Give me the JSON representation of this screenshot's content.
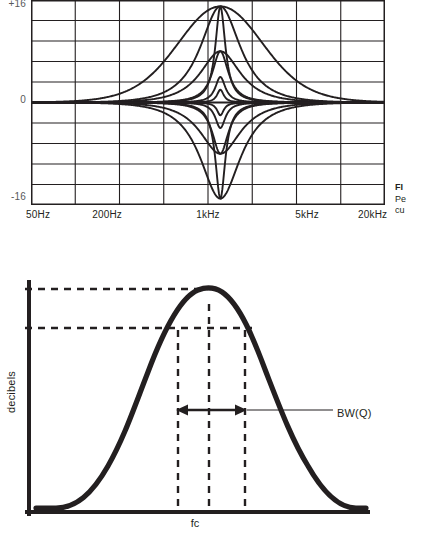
{
  "document": {
    "title": "Parametric EQ response curves and bandwidth diagram",
    "page_background": "#ffffff",
    "ink_color": "#231f20",
    "grid_color": "#231f20",
    "axis_label_color": "#58595b"
  },
  "figure_one": {
    "caption": {
      "head": "FI",
      "lines": [
        "Pe",
        "cu"
      ]
    },
    "y_axis": {
      "label_top": "+16",
      "label_mid": "0",
      "label_bottom": "-16",
      "units": "dB",
      "range": [
        -16,
        16
      ]
    },
    "x_axis": {
      "ticks": [
        "50Hz",
        "200Hz",
        "1kHz",
        "5kHz",
        "20kHz"
      ],
      "tick_positions_pct": [
        2,
        21.5,
        50,
        78,
        96.5
      ],
      "scale": "logarithmic"
    },
    "grid": {
      "columns": 8,
      "rows": 10,
      "vertical_lines": 7,
      "horizontal_lines": 9,
      "border": true
    }
  },
  "chart_data": [
    {
      "type": "line",
      "title": "Parametric EQ peaking filter family",
      "xlabel": "",
      "ylabel": "",
      "xtick_labels": [
        "50Hz",
        "200Hz",
        "1kHz",
        "5kHz",
        "20kHz"
      ],
      "ytick_labels": [
        "+16",
        "0",
        "-16"
      ],
      "ylim": [
        -16,
        16
      ],
      "xlim_hz": [
        20,
        30000
      ],
      "xscale": "log",
      "grid": true,
      "legend": "none",
      "center_frequency_hz": 1000,
      "series": [
        {
          "name": "boost +15 dB, Q 0.4",
          "gain_db": 15.0,
          "q": 0.4,
          "fc_hz": 1000
        },
        {
          "name": "boost +15 dB, Q 1.0",
          "gain_db": 15.0,
          "q": 1.0,
          "fc_hz": 1000
        },
        {
          "name": "boost +15 dB, Q 4.0",
          "gain_db": 15.0,
          "q": 4.0,
          "fc_hz": 1000
        },
        {
          "name": "boost +8 dB, Q 1.0",
          "gain_db": 8.0,
          "q": 1.0,
          "fc_hz": 1000
        },
        {
          "name": "boost +8 dB, Q 2.5",
          "gain_db": 8.0,
          "q": 2.5,
          "fc_hz": 1000
        },
        {
          "name": "boost +4 dB, Q 4.0",
          "gain_db": 4.0,
          "q": 4.0,
          "fc_hz": 1000
        },
        {
          "name": "boost +2 dB, Q 6.0",
          "gain_db": 2.0,
          "q": 6.0,
          "fc_hz": 1000
        },
        {
          "name": "cut -2 dB, Q 6.0",
          "gain_db": -2.0,
          "q": 6.0,
          "fc_hz": 1000
        },
        {
          "name": "cut -4 dB, Q 4.0",
          "gain_db": -4.0,
          "q": 4.0,
          "fc_hz": 1000
        },
        {
          "name": "cut -8 dB, Q 2.5",
          "gain_db": -8.0,
          "q": 2.5,
          "fc_hz": 1000
        },
        {
          "name": "cut -8 dB, Q 1.0",
          "gain_db": -8.0,
          "q": 1.0,
          "fc_hz": 1000
        },
        {
          "name": "cut -15 dB, Q 4.0",
          "gain_db": -15.0,
          "q": 4.0,
          "fc_hz": 1000
        },
        {
          "name": "cut -15 dB, Q 1.0",
          "gain_db": -15.0,
          "q": 1.0,
          "fc_hz": 1000
        }
      ]
    },
    {
      "type": "line",
      "title": "Bandwidth / Q of a peaking filter",
      "xlabel": "fc",
      "ylabel": "decibels",
      "grid": false,
      "legend": "none",
      "annotations": [
        "BW(Q)"
      ],
      "peak_marker": "fc",
      "dashed_reference_levels": [
        "peak",
        "peak minus 3 dB"
      ],
      "series": [
        {
          "name": "peak response",
          "shape": "bell",
          "peak_x_pct": 50,
          "peak_y_pct": 95
        }
      ]
    }
  ],
  "figure_two": {
    "caption": {
      "head": "FI",
      "lines": [
        "Th",
        "be",
        "po",
        "do",
        "fre",
        "the",
        "ne"
      ]
    },
    "y_axis_label": "decibels",
    "x_axis_label": "fc",
    "bandwidth_annotation": "BW(Q)"
  }
}
